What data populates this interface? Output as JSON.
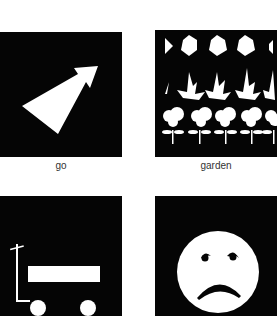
{
  "cards": [
    {
      "label": "go",
      "icon": "arrow-up-right-icon"
    },
    {
      "label": "garden",
      "icon": "garden-plants-icon"
    },
    {
      "label": "",
      "icon": "wagon-icon"
    },
    {
      "label": "",
      "icon": "sad-face-icon"
    }
  ],
  "colors": {
    "panel": "#050505",
    "symbol": "#ffffff",
    "background": "#ffffff",
    "label": "#333333"
  }
}
